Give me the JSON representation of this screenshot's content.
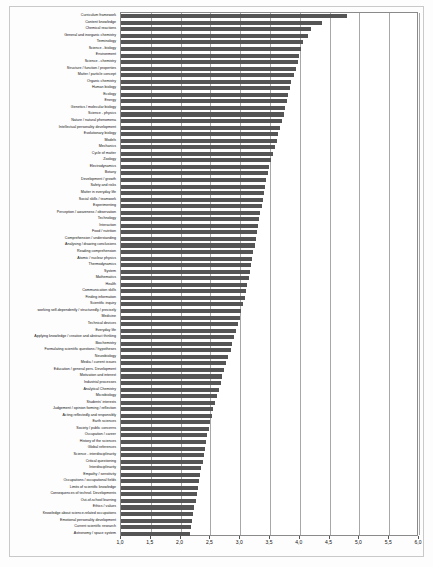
{
  "chart_data": {
    "type": "bar",
    "orientation": "horizontal",
    "title": "",
    "subtitle": "",
    "xlabel": "",
    "ylabel": "",
    "xlim": [
      1.0,
      6.0
    ],
    "grid": true,
    "legend": null,
    "xticks": [
      "1,0",
      "1,5",
      "2,0",
      "2,5",
      "3,0",
      "3,5",
      "4,0",
      "4,5",
      "5,0",
      "5,5",
      "6,0"
    ],
    "xtick_values": [
      1.0,
      1.5,
      2.0,
      2.5,
      3.0,
      3.5,
      4.0,
      4.5,
      5.0,
      5.5,
      6.0
    ],
    "bar_color": "#555555",
    "categories": [
      "Curriculum framework",
      "Content knowledge",
      "Chemical reactions",
      "General and inorganic chemistry",
      "Terminology",
      "Science - biology",
      "Environment",
      "Science - chemistry",
      "Structure / function / properties",
      "Matter / particle concept",
      "Organic chemistry",
      "Human biology",
      "Ecology",
      "Energy",
      "Genetics / molecular biology",
      "Science - physics",
      "Nature / natural phenomena",
      "Intellectual personality development",
      "Evolutionary biology",
      "Models",
      "Mechanics",
      "Cycle of matter",
      "Zoology",
      "Electrodynamics",
      "Botany",
      "Development / growth",
      "Safety and risks",
      "Matter in everyday life",
      "Social skills / teamwork",
      "Experimenting",
      "Perception / awareness / observation",
      "Technology",
      "Interaction",
      "Food / nutrition",
      "Comprehension / understanding",
      "Analysing / drawing conclusions",
      "Reading comprehension",
      "Atomic / nuclear physics",
      "Thermodynamics",
      "System",
      "Mathematics",
      "Health",
      "Communication skills",
      "Finding information",
      "Scientific inquiry",
      "working self-dependently / structuredly / precisely",
      "Medicine",
      "Technical devices",
      "Everyday life",
      "Applying knowledge / creative and abstract thinking",
      "Biochemistry",
      "Formulating scientific questions / hypotheses",
      "Neurobiology",
      "Media / current issues",
      "Education / general pers. Development",
      "Motivation and interest",
      "Industrial processes",
      "Analytical Chemistry",
      "Microbiology",
      "Students' interests",
      "Judgement / opinion forming / reflection",
      "Acting reflectedly and responsibly",
      "Earth sciences",
      "Society / public concerns",
      "Occupation / career",
      "History of the sciences",
      "Global references",
      "Science - interdisciplinarity",
      "Critical questioning",
      "Interdisciplinarity",
      "Empathy / sensitivity",
      "Occupations / occupational fields",
      "Limits of scientific knowledge",
      "Consequences of technol. Developments",
      "Out-of-school learning",
      "Ethics / values",
      "Knowledge about science-related occupations",
      "Emotional personality development",
      "Current scientific research",
      "Astronomy / space system"
    ],
    "values": [
      4.8,
      4.38,
      4.18,
      4.14,
      4.06,
      4.02,
      3.99,
      3.97,
      3.93,
      3.9,
      3.86,
      3.83,
      3.81,
      3.78,
      3.76,
      3.73,
      3.7,
      3.67,
      3.64,
      3.62,
      3.58,
      3.55,
      3.52,
      3.49,
      3.46,
      3.44,
      3.42,
      3.4,
      3.38,
      3.36,
      3.34,
      3.32,
      3.3,
      3.28,
      3.26,
      3.24,
      3.22,
      3.2,
      3.18,
      3.16,
      3.14,
      3.12,
      3.1,
      3.08,
      3.05,
      3.02,
      2.99,
      2.96,
      2.93,
      2.9,
      2.87,
      2.84,
      2.8,
      2.76,
      2.73,
      2.7,
      2.67,
      2.64,
      2.61,
      2.58,
      2.55,
      2.52,
      2.49,
      2.47,
      2.45,
      2.43,
      2.41,
      2.39,
      2.37,
      2.35,
      2.33,
      2.31,
      2.29,
      2.27,
      2.25,
      2.23,
      2.21,
      2.19,
      2.17,
      2.15
    ]
  }
}
